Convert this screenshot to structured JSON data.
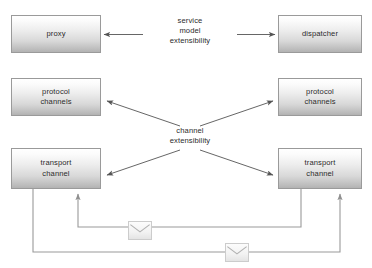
{
  "diagram": {
    "background_color": "#ffffff",
    "box_border_color": "#9a9a9a",
    "line_color": "#555555",
    "wire_color": "#9a9a9a",
    "text_color": "#2b2b2b",
    "nodes": [
      {
        "id": "proxy",
        "label": "proxy",
        "x": 11,
        "y": 15,
        "w": 90,
        "h": 38
      },
      {
        "id": "dispatcher",
        "label": "dispatcher",
        "x": 278,
        "y": 15,
        "w": 84,
        "h": 38
      },
      {
        "id": "protocol-left",
        "label": "protocol\nchannels",
        "x": 11,
        "y": 78,
        "w": 90,
        "h": 38
      },
      {
        "id": "protocol-right",
        "label": "protocol\nchannels",
        "x": 278,
        "y": 78,
        "w": 84,
        "h": 38
      },
      {
        "id": "transport-left",
        "label": "transport\nchannel",
        "x": 11,
        "y": 148,
        "w": 90,
        "h": 41
      },
      {
        "id": "transport-right",
        "label": "transport\nchannel",
        "x": 278,
        "y": 148,
        "w": 84,
        "h": 41
      }
    ],
    "annotations": [
      {
        "id": "service-model-extensibility",
        "label": "service\nmodel\nextensibility",
        "x": 144,
        "y": 16,
        "w": 92
      },
      {
        "id": "channel-extensibility",
        "label": "channel\nextensibility",
        "x": 144,
        "y": 126,
        "w": 92
      }
    ],
    "envelopes": [
      {
        "id": "envelope-upper",
        "x": 128,
        "y": 221,
        "w": 24,
        "h": 19
      },
      {
        "id": "envelope-lower",
        "x": 225,
        "y": 243,
        "w": 24,
        "h": 19
      }
    ]
  }
}
